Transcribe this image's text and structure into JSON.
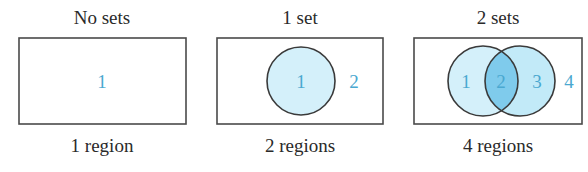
{
  "colors": {
    "outline": "#3a3a3a",
    "set_fill": "#d4f0fa",
    "intersection_fill": "#7fcbec",
    "region_label": "#4aa8d0",
    "caption": "#2a2a2a"
  },
  "panels": [
    {
      "title": "No sets",
      "caption": "1 region",
      "region_labels": [
        "1"
      ]
    },
    {
      "title": "1 set",
      "caption": "2 regions",
      "region_labels": [
        "1",
        "2"
      ]
    },
    {
      "title": "2 sets",
      "caption": "4 regions",
      "region_labels": [
        "1",
        "2",
        "3",
        "4"
      ]
    }
  ]
}
